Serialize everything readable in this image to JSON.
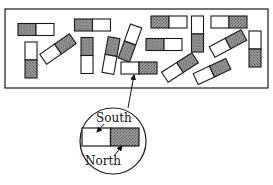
{
  "figure": {
    "colors": {
      "stroke": "#1a1a1a",
      "shaded_pole": "#8a8a8a",
      "unshaded_pole": "#ffffff"
    },
    "container": {
      "x": 5,
      "y": 9,
      "width": 263,
      "height": 79
    },
    "magnets": [
      {
        "id": "A",
        "cx": 36,
        "cy": 29.5,
        "angle": 0,
        "shaded": "left"
      },
      {
        "id": "B",
        "cx": 31,
        "cy": 60,
        "angle": 90,
        "shaded": "right"
      },
      {
        "id": "C",
        "cx": 58,
        "cy": 49,
        "angle": -35,
        "shaded": "right"
      },
      {
        "id": "D",
        "cx": 92.5,
        "cy": 25,
        "angle": 0,
        "shaded": "left"
      },
      {
        "id": "E",
        "cx": 87,
        "cy": 55.5,
        "angle": 90,
        "shaded": "left"
      },
      {
        "id": "F",
        "cx": 111,
        "cy": 55.5,
        "angle": 100,
        "shaded": "left"
      },
      {
        "id": "G",
        "cx": 130,
        "cy": 43,
        "angle": 110,
        "shaded": "right"
      },
      {
        "id": "H",
        "cx": 169,
        "cy": 22,
        "angle": 0,
        "shaded": "left"
      },
      {
        "id": "I",
        "cx": 164,
        "cy": 44.5,
        "angle": 0,
        "shaded": "left"
      },
      {
        "id": "J",
        "cx": 197.5,
        "cy": 34,
        "angle": 90,
        "shaded": "right"
      },
      {
        "id": "K",
        "cx": 229,
        "cy": 22,
        "angle": 0,
        "shaded": "right"
      },
      {
        "id": "L",
        "cx": 228,
        "cy": 43.5,
        "angle": -28,
        "shaded": "right"
      },
      {
        "id": "M",
        "cx": 255,
        "cy": 49,
        "angle": 90,
        "shaded": "right"
      },
      {
        "id": "N",
        "cx": 139,
        "cy": 68,
        "angle": 0,
        "shaded": "right"
      },
      {
        "id": "O",
        "cx": 180,
        "cy": 67.5,
        "angle": -33,
        "shaded": "right"
      },
      {
        "id": "P",
        "cx": 212,
        "cy": 71.5,
        "angle": -25,
        "shaded": "right"
      }
    ],
    "magnet_size": {
      "length": 36,
      "width": 12
    },
    "inset": {
      "circle": {
        "cx": 113,
        "cy": 141,
        "r": 33
      },
      "magnet": {
        "x": 82,
        "y": 128,
        "width": 57,
        "height": 18,
        "shaded": "right"
      },
      "labels": {
        "south": "South",
        "north": "North"
      }
    },
    "pointer": {
      "from": [
        128,
        108
      ],
      "to": [
        134,
        75
      ]
    }
  }
}
